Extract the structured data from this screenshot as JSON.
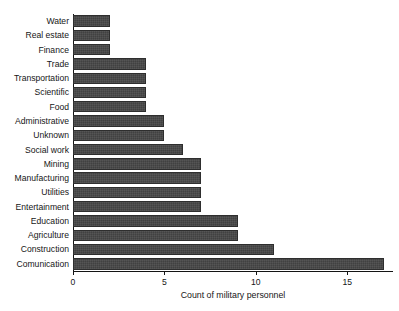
{
  "chart_data": {
    "type": "bar",
    "orientation": "horizontal",
    "title": "",
    "xlabel": "Count of military personnel",
    "ylabel": "",
    "xlim": [
      0,
      17.5
    ],
    "xticks": [
      0,
      5,
      10,
      15
    ],
    "xtick_labels": [
      "0",
      "5",
      "10",
      "15"
    ],
    "grid": false,
    "legend": null,
    "bar_color": "#414141",
    "categories": [
      "Water",
      "Real estate",
      "Finance",
      "Trade",
      "Transportation",
      "Scientific",
      "Food",
      "Administrative",
      "Unknown",
      "Social work",
      "Mining",
      "Manufacturing",
      "Utilities",
      "Entertainment",
      "Education",
      "Agriculture",
      "Construction",
      "Comunication"
    ],
    "values": [
      2,
      2,
      2,
      4,
      4,
      4,
      4,
      5,
      5,
      6,
      7,
      7,
      7,
      7,
      9,
      9,
      11,
      17
    ]
  }
}
